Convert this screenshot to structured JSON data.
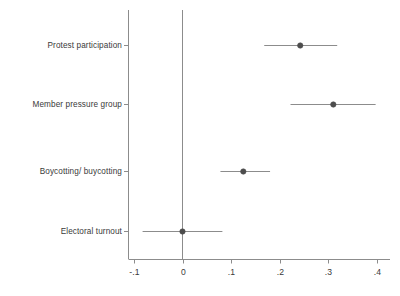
{
  "chart_data": {
    "type": "scatter",
    "subtype": "coefficient-plot-with-confidence-intervals",
    "title": "",
    "subtitle": "",
    "xlabel": "",
    "ylabel": "",
    "xlim": [
      -0.13,
      0.41
    ],
    "xticks": [
      -0.1,
      0,
      0.1,
      0.2,
      0.3,
      0.4
    ],
    "xticklabels": [
      "-.1",
      "0",
      ".1",
      ".2",
      ".3",
      ".4"
    ],
    "grid": false,
    "legend": null,
    "zero_reference_line": 0,
    "orientation": "horizontal",
    "categories": [
      "Protest participation",
      "Member pressure group",
      "Boycotting/ buycotting",
      "Electoral turnout"
    ],
    "points": [
      {
        "category": "Protest participation",
        "estimate": 0.242,
        "ci_low": 0.168,
        "ci_high": 0.318,
        "significant": true
      },
      {
        "category": "Member pressure group",
        "estimate": 0.31,
        "ci_low": 0.222,
        "ci_high": 0.397,
        "significant": true
      },
      {
        "category": "Boycotting/ buycotting",
        "estimate": 0.125,
        "ci_low": 0.078,
        "ci_high": 0.18,
        "significant": true
      },
      {
        "category": "Electoral turnout",
        "estimate": 0.0,
        "ci_low": -0.082,
        "ci_high": 0.082,
        "significant": false
      }
    ],
    "colors": {
      "marker": "#4d4d4d",
      "whisker": "#8c8c8c",
      "axis": "#8c8c8c",
      "zero_line": "#8c8c8c",
      "text": "#3a3a3a",
      "background": "#ffffff"
    }
  }
}
